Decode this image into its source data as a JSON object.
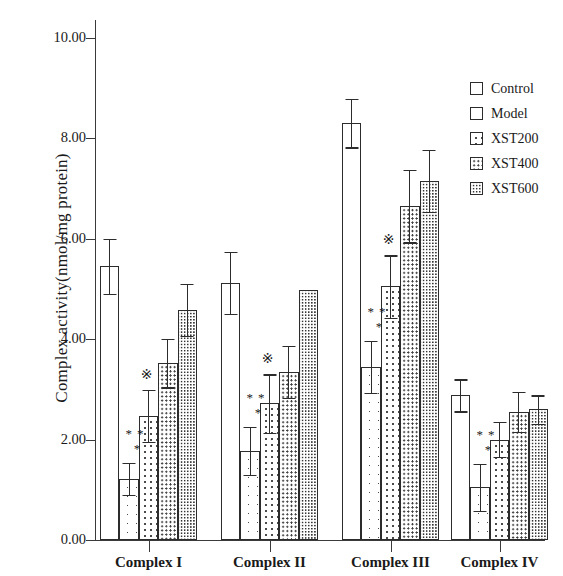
{
  "chart_data": {
    "type": "bar",
    "title": "",
    "xlabel": "",
    "ylabel": "Complex activity(nmol/mg protein)",
    "categories": [
      "Complex I",
      "Complex II",
      "Complex III",
      "Complex IV"
    ],
    "ylim": [
      0.0,
      10.8
    ],
    "yticks": [
      "0.00",
      "2.00",
      "4.00",
      "6.00",
      "8.00",
      "10.00"
    ],
    "ytick_values": [
      0.0,
      2.0,
      4.0,
      6.0,
      8.0,
      10.0
    ],
    "grid": false,
    "legend_position": "top-right",
    "error_type": "SD",
    "series": [
      {
        "name": "Control",
        "pattern": "none",
        "values": [
          5.45,
          5.12,
          8.3,
          2.88
        ],
        "errors": [
          0.55,
          0.62,
          0.48,
          0.32
        ]
      },
      {
        "name": "Model",
        "pattern": "sparse-dots",
        "values": [
          1.22,
          1.77,
          3.45,
          1.05
        ],
        "errors": [
          0.32,
          0.48,
          0.52,
          0.47
        ]
      },
      {
        "name": "XST200",
        "pattern": "medium-dots",
        "values": [
          2.47,
          2.72,
          5.05,
          2.0
        ],
        "errors": [
          0.52,
          0.58,
          0.62,
          0.35
        ]
      },
      {
        "name": "XST400",
        "pattern": "dense-dots",
        "values": [
          3.52,
          3.35,
          6.65,
          2.55
        ],
        "errors": [
          0.48,
          0.52,
          0.72,
          0.4
        ]
      },
      {
        "name": "XST600",
        "pattern": "very-dense-dots",
        "values": [
          4.58,
          4.98,
          7.15,
          2.6
        ],
        "errors": [
          0.52,
          0.0,
          0.62,
          0.28
        ]
      }
    ],
    "annotations": [
      {
        "group": "Complex I",
        "series": "Model",
        "text": "**\n*",
        "meaning": "significant vs Control"
      },
      {
        "group": "Complex I",
        "series": "XST200",
        "text": "※",
        "meaning": "significant vs Model"
      },
      {
        "group": "Complex II",
        "series": "Model",
        "text": "**\n*",
        "meaning": "significant vs Control"
      },
      {
        "group": "Complex II",
        "series": "XST200",
        "text": "※",
        "meaning": "significant vs Model"
      },
      {
        "group": "Complex III",
        "series": "Model",
        "text": "**\n*",
        "meaning": "significant vs Control"
      },
      {
        "group": "Complex III",
        "series": "XST200",
        "text": "※",
        "meaning": "significant vs Model"
      },
      {
        "group": "Complex IV",
        "series": "Model",
        "text": "**\n*",
        "meaning": "significant vs Control"
      }
    ]
  },
  "axis": {
    "y_title": "Complex activity(nmol/mg protein)",
    "ticks": [
      {
        "label": "10.00",
        "value": 10.0
      },
      {
        "label": "8.00",
        "value": 8.0
      },
      {
        "label": "6.00",
        "value": 6.0
      },
      {
        "label": "4.00",
        "value": 4.0
      },
      {
        "label": "2.00",
        "value": 2.0
      },
      {
        "label": "0.00",
        "value": 0.0
      }
    ],
    "groups": [
      "Complex I",
      "Complex II",
      "Complex III",
      "Complex IV"
    ]
  },
  "legend": {
    "items": [
      {
        "label": "Control",
        "pattern": "none"
      },
      {
        "label": "Model",
        "pattern": "none"
      },
      {
        "label": "XST200",
        "pattern": "medium-dots"
      },
      {
        "label": "XST400",
        "pattern": "dense-dots"
      },
      {
        "label": "XST600",
        "pattern": "very-dense-dots"
      }
    ]
  },
  "markers": {
    "double_star": "**",
    "single_star": "*",
    "reference": "※"
  },
  "colors": {
    "ink": "#2c2c2c",
    "background": "#ffffff",
    "dots": "#4a4a4a"
  }
}
